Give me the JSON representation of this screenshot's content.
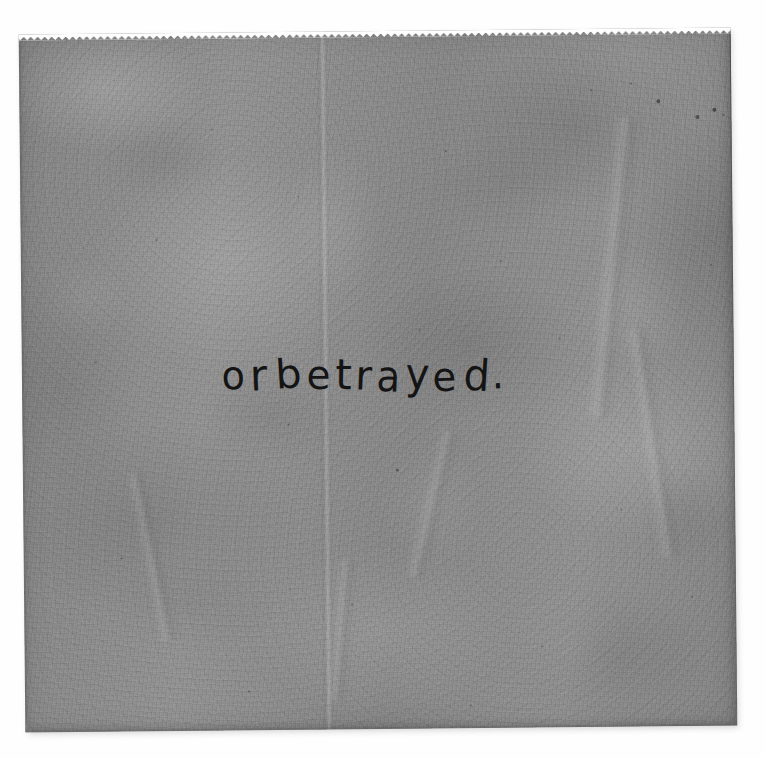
{
  "canvas": {
    "width": 766,
    "height": 758,
    "background_color": "#fefefe"
  },
  "artwork": {
    "medium": "handwritten ink on translucent gray paper",
    "paper": {
      "base_color": "#8d8d8d",
      "top_edge_style": "pinked-serrated",
      "left_px": 22,
      "top_px": 31,
      "width_px": 714,
      "height_px": 700,
      "rotation_deg": -0.55
    },
    "crease": {
      "orientation": "vertical",
      "x_px": 325,
      "color": "#ffffff"
    },
    "inscription": {
      "text": "or betrayed.",
      "ink_color": "#141414",
      "baseline_y_px": 390,
      "start_x_px": 222,
      "end_x_px": 505,
      "font_size_px": 40,
      "style": "handwritten lowercase"
    }
  },
  "specks": [
    {
      "x": 661,
      "y": 104,
      "r": 2.0,
      "o": 0.55
    },
    {
      "x": 700,
      "y": 120,
      "r": 1.6,
      "o": 0.5
    },
    {
      "x": 717,
      "y": 113,
      "r": 2.4,
      "o": 0.62
    },
    {
      "x": 726,
      "y": 118,
      "r": 1.4,
      "o": 0.45
    },
    {
      "x": 634,
      "y": 86,
      "r": 1.3,
      "o": 0.4
    },
    {
      "x": 594,
      "y": 92,
      "r": 1.1,
      "o": 0.35
    },
    {
      "x": 448,
      "y": 152,
      "r": 1.2,
      "o": 0.38
    },
    {
      "x": 214,
      "y": 128,
      "r": 1.1,
      "o": 0.33
    },
    {
      "x": 158,
      "y": 238,
      "r": 1.3,
      "o": 0.36
    },
    {
      "x": 502,
      "y": 262,
      "r": 1.2,
      "o": 0.34
    },
    {
      "x": 560,
      "y": 340,
      "r": 1.1,
      "o": 0.32
    },
    {
      "x": 288,
      "y": 424,
      "r": 1.3,
      "o": 0.36
    },
    {
      "x": 396,
      "y": 470,
      "r": 1.5,
      "o": 0.44
    },
    {
      "x": 620,
      "y": 512,
      "r": 1.2,
      "o": 0.33
    },
    {
      "x": 120,
      "y": 556,
      "r": 1.4,
      "o": 0.38
    },
    {
      "x": 350,
      "y": 604,
      "r": 1.1,
      "o": 0.31
    },
    {
      "x": 540,
      "y": 648,
      "r": 1.3,
      "o": 0.35
    },
    {
      "x": 690,
      "y": 600,
      "r": 1.2,
      "o": 0.33
    },
    {
      "x": 246,
      "y": 690,
      "r": 1.3,
      "o": 0.34
    },
    {
      "x": 468,
      "y": 706,
      "r": 1.1,
      "o": 0.3
    },
    {
      "x": 96,
      "y": 360,
      "r": 1.2,
      "o": 0.32
    },
    {
      "x": 712,
      "y": 268,
      "r": 1.4,
      "o": 0.38
    },
    {
      "x": 300,
      "y": 196,
      "r": 1.0,
      "o": 0.28
    },
    {
      "x": 420,
      "y": 330,
      "r": 1.0,
      "o": 0.28
    }
  ],
  "wrinkles": [
    {
      "x": 600,
      "y": 120,
      "w": 30,
      "h": 300,
      "rot": 6
    },
    {
      "x": 640,
      "y": 330,
      "w": 26,
      "h": 230,
      "rot": -8
    },
    {
      "x": 420,
      "y": 430,
      "w": 24,
      "h": 150,
      "rot": 14
    },
    {
      "x": 140,
      "y": 470,
      "w": 22,
      "h": 170,
      "rot": -11
    },
    {
      "x": 330,
      "y": 560,
      "w": 20,
      "h": 140,
      "rot": 5
    }
  ]
}
